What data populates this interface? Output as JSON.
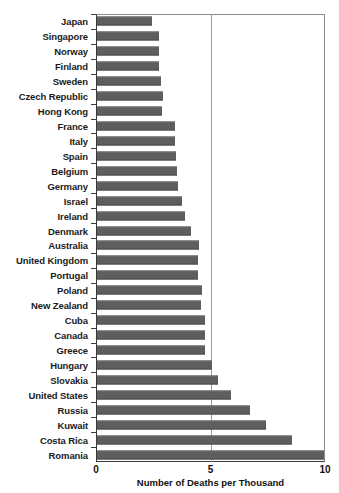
{
  "chart_data": {
    "type": "bar",
    "orientation": "horizontal",
    "title": "",
    "xlabel": "Number of Deaths per Thousand",
    "ylabel": "",
    "xlim": [
      0,
      10
    ],
    "xticks": [
      0,
      5,
      10
    ],
    "xticklabels": [
      "0",
      "5",
      "10"
    ],
    "grid": "vertical gridline at x=5",
    "legend": "none",
    "bar_color": "#5e5e5e",
    "categories": [
      "Japan",
      "Singapore",
      "Norway",
      "Finland",
      "Sweden",
      "Czech Republic",
      "Hong Kong",
      "France",
      "Italy",
      "Spain",
      "Belgium",
      "Germany",
      "Israel",
      "Ireland",
      "Denmark",
      "Australia",
      "United Kingdom",
      "Portugal",
      "Poland",
      "New Zealand",
      "Cuba",
      "Canada",
      "Greece",
      "Hungary",
      "Slovakia",
      "United States",
      "Russia",
      "Kuwait",
      "Costa Rica",
      "Romania"
    ],
    "values": [
      2.4,
      2.7,
      2.7,
      2.7,
      2.8,
      2.9,
      2.85,
      3.4,
      3.4,
      3.45,
      3.5,
      3.55,
      3.7,
      3.85,
      4.1,
      4.45,
      4.4,
      4.4,
      4.6,
      4.55,
      4.7,
      4.7,
      4.7,
      5.0,
      5.3,
      5.85,
      6.7,
      7.4,
      8.5,
      9.9
    ]
  }
}
